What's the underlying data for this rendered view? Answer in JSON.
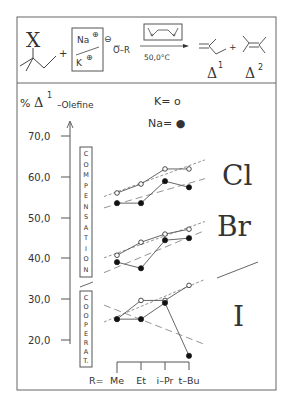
{
  "reaction": {
    "substituent": "X",
    "plus1": "+",
    "cation_top": "Na",
    "cation_bottom": "K",
    "charge_plus": "⊕",
    "anion_charge": "⊖",
    "alkoxide": "O–R",
    "conditions": "50,0°C",
    "plus2": "+",
    "product1_label": "Δ",
    "product1_sup": "1",
    "product2_label": "Δ",
    "product2_sup": "2"
  },
  "legend": {
    "y_title_prefix": "%",
    "y_title_delta": "Δ",
    "y_title_sup": "1",
    "y_title_suffix": "–Olefine",
    "k_label": "K= o",
    "na_label": "Na= ●"
  },
  "boxes": {
    "compensation": [
      "C",
      "O",
      "M",
      "P",
      "E",
      "N",
      "S",
      "A",
      "T",
      "I",
      "O",
      "N"
    ],
    "cooperat": [
      "C",
      "O",
      "O",
      "P",
      "E",
      "R",
      "A",
      "T."
    ]
  },
  "halogens": [
    "Cl",
    "Br",
    "I"
  ],
  "axis": {
    "ticks": [
      "70,0",
      "60,0",
      "50,0",
      "40,0",
      "30,0",
      "20,0"
    ],
    "x_prefix": "R=",
    "x_labels": [
      "Me",
      "Et",
      "i–Pr",
      "t–Bu"
    ]
  },
  "chart_data": {
    "type": "line",
    "ylabel": "% Δ1-Olefine",
    "xlabel": "R",
    "categories": [
      "Me",
      "Et",
      "i-Pr",
      "t-Bu"
    ],
    "ylim": [
      20,
      70
    ],
    "yticks": [
      20,
      30,
      40,
      50,
      60,
      70
    ],
    "legend": {
      "K": "open circle",
      "Na": "filled circle"
    },
    "groups": [
      {
        "halogen": "Cl",
        "region": "Compensation",
        "series": [
          {
            "name": "K",
            "values": [
              56.0,
              58.2,
              61.9,
              61.9
            ]
          },
          {
            "name": "Na",
            "values": [
              53.5,
              53.5,
              58.9,
              57.4
            ]
          }
        ]
      },
      {
        "halogen": "Br",
        "region": "Compensation",
        "series": [
          {
            "name": "K",
            "values": [
              40.7,
              43.9,
              45.9,
              47.1
            ]
          },
          {
            "name": "Na",
            "values": [
              39.0,
              37.5,
              44.4,
              44.9
            ]
          }
        ]
      },
      {
        "halogen": "I",
        "region": "Cooperation",
        "series": [
          {
            "name": "K",
            "values": [
              25.0,
              29.6,
              29.6,
              33.3
            ]
          },
          {
            "name": "Na",
            "values": [
              25.0,
              25.0,
              29.0,
              16.0
            ]
          }
        ]
      }
    ]
  }
}
